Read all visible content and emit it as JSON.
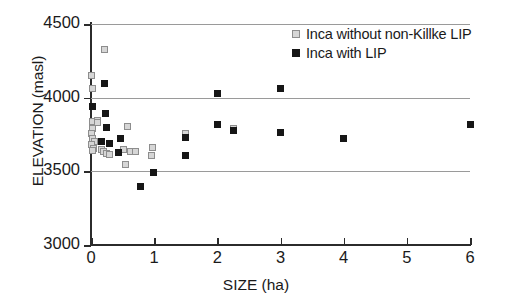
{
  "chart_data": {
    "type": "scatter",
    "title": "",
    "xlabel": "SIZE (ha)",
    "ylabel": "ELEVATION (masl)",
    "xlim": [
      0,
      6
    ],
    "ylim": [
      3000,
      4500
    ],
    "xticks": [
      "0",
      "1",
      "2",
      "3",
      "4",
      "5",
      "6"
    ],
    "xtick_values": [
      0,
      1,
      2,
      3,
      4,
      5,
      6
    ],
    "yticks": [
      "3000",
      "3500",
      "4000",
      "4500"
    ],
    "ytick_values": [
      3000,
      3500,
      4000,
      4500
    ],
    "grid": "horizontal",
    "gridlines": [
      3500,
      4000,
      4500
    ],
    "legend_position": "top-right",
    "series": [
      {
        "name": "Inca without non-Killke LIP",
        "marker": "open-square",
        "color": "#d6d6d6",
        "edge_color": "#8d8d8d",
        "points": [
          [
            0.22,
            4325
          ],
          [
            0.0,
            4150
          ],
          [
            0.02,
            4060
          ],
          [
            0.03,
            3835
          ],
          [
            0.1,
            3845
          ],
          [
            0.11,
            3830
          ],
          [
            0.02,
            3790
          ],
          [
            0.01,
            3760
          ],
          [
            0.02,
            3720
          ],
          [
            0.06,
            3700
          ],
          [
            0.01,
            3685
          ],
          [
            0.04,
            3655
          ],
          [
            0.02,
            3640
          ],
          [
            0.16,
            3650
          ],
          [
            0.2,
            3635
          ],
          [
            0.25,
            3620
          ],
          [
            0.29,
            3615
          ],
          [
            0.58,
            3805
          ],
          [
            0.52,
            3648
          ],
          [
            0.62,
            3638
          ],
          [
            0.7,
            3632
          ],
          [
            0.97,
            3665
          ],
          [
            0.95,
            3605
          ],
          [
            0.55,
            3545
          ],
          [
            1.5,
            3755
          ],
          [
            2.25,
            3790
          ]
        ]
      },
      {
        "name": "Inca with LIP",
        "marker": "filled-square",
        "color": "#161616",
        "points": [
          [
            0.22,
            4095
          ],
          [
            0.02,
            3940
          ],
          [
            0.23,
            3895
          ],
          [
            0.25,
            3795
          ],
          [
            0.16,
            3700
          ],
          [
            0.29,
            3690
          ],
          [
            0.46,
            3725
          ],
          [
            0.44,
            3625
          ],
          [
            0.79,
            3395
          ],
          [
            0.99,
            3490
          ],
          [
            1.5,
            3730
          ],
          [
            1.5,
            3610
          ],
          [
            2.0,
            4030
          ],
          [
            2.0,
            3820
          ],
          [
            2.25,
            3775
          ],
          [
            3.0,
            4060
          ],
          [
            3.0,
            3765
          ],
          [
            4.0,
            3725
          ],
          [
            6.0,
            3815
          ]
        ]
      }
    ]
  }
}
